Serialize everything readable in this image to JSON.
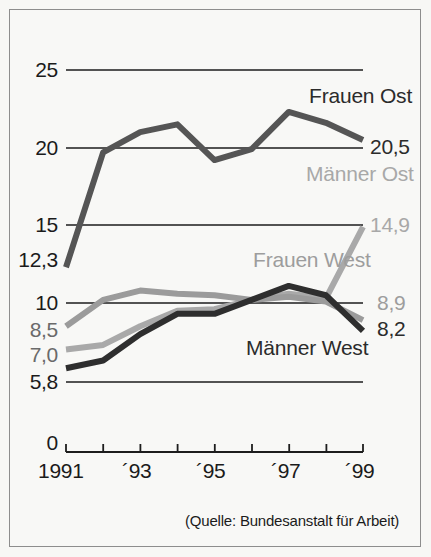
{
  "figure": {
    "source_note": "(Quelle: Bundesanstalt für Arbeit)"
  },
  "chart_data": {
    "type": "line",
    "title": "",
    "subtitle": "",
    "xlabel": "",
    "ylabel": "",
    "xlim": [
      1991,
      1999
    ],
    "ylim": [
      0,
      25
    ],
    "yticks": [
      0,
      5.8,
      10,
      15,
      20,
      25
    ],
    "ytick_labels": [
      "0",
      "5,8",
      "10",
      "15",
      "20",
      "25"
    ],
    "extra_ytick_labels": [
      "12,3",
      "8,5",
      "7,0"
    ],
    "x": [
      1991,
      1992,
      1993,
      1994,
      1995,
      1996,
      1997,
      1998,
      1999
    ],
    "xtick_labels": [
      "1991",
      "",
      "´93",
      "",
      "´95",
      "",
      "´97",
      "",
      "´99"
    ],
    "grid": "horizontal",
    "legend_position": "inline-right",
    "series": [
      {
        "name": "Frauen Ost",
        "color": "#555555",
        "start_label": "12,3",
        "end_label": "20,5",
        "values": [
          12.3,
          19.7,
          21.0,
          21.5,
          19.2,
          19.9,
          22.3,
          21.6,
          20.5
        ]
      },
      {
        "name": "Männer Ost",
        "color": "#a9a9a9",
        "start_label": "7,0",
        "end_label": "14,9",
        "values": [
          7.0,
          7.3,
          8.5,
          9.5,
          9.6,
          10.2,
          10.6,
          10.3,
          14.9
        ]
      },
      {
        "name": "Frauen West",
        "color": "#9b9b9b",
        "start_label": "8,5",
        "end_label": "8,9",
        "values": [
          8.5,
          10.2,
          10.8,
          10.6,
          10.5,
          10.2,
          10.4,
          10.1,
          8.9
        ]
      },
      {
        "name": "Männer West",
        "color": "#2e2e2e",
        "start_label": "5,8",
        "end_label": "8,2",
        "values": [
          5.8,
          6.3,
          8.0,
          9.3,
          9.3,
          10.2,
          11.1,
          10.5,
          8.2
        ]
      }
    ],
    "annotations": [
      {
        "text": "Frauen Ost",
        "color": "#4a4a4a"
      },
      {
        "text": "20,5",
        "color": "#2b2b2b"
      },
      {
        "text": "Männer Ost",
        "color": "#a8a8a8"
      },
      {
        "text": "14,9",
        "color": "#a8a8a8"
      },
      {
        "text": "Frauen West",
        "color": "#9d9d9d"
      },
      {
        "text": "8,9",
        "color": "#9d9d9d"
      },
      {
        "text": "8,2",
        "color": "#1b1b1b"
      },
      {
        "text": "Männer West",
        "color": "#1b1b1b"
      }
    ]
  },
  "axis": {
    "y": {
      "t25": "25",
      "t20": "20",
      "t15": "15",
      "t123": "12,3",
      "t10": "10",
      "t85": "8,5",
      "t70": "7,0",
      "t58": "5,8",
      "t0": "0"
    },
    "x": {
      "t1991": "1991",
      "t93": "´93",
      "t95": "´95",
      "t97": "´97",
      "t99": "´99"
    }
  },
  "labels": {
    "frauen_ost": "Frauen Ost",
    "frauen_ost_value": "20,5",
    "maenner_ost": "Männer Ost",
    "maenner_ost_value": "14,9",
    "frauen_west": "Frauen West",
    "frauen_west_value": "8,9",
    "maenner_west": "Männer West",
    "maenner_west_value": "8,2"
  }
}
